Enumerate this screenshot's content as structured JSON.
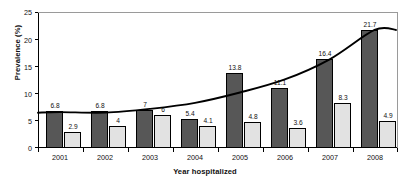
{
  "chart_data": {
    "type": "bar",
    "title": "",
    "xlabel": "Year hospitalized",
    "ylabel": "Prevalence (%)",
    "categories": [
      "2001",
      "2002",
      "2003",
      "2004",
      "2005",
      "2006",
      "2007",
      "2008"
    ],
    "ylim": [
      0,
      25
    ],
    "yticks": [
      "0",
      "5",
      "10",
      "15",
      "20",
      "25"
    ],
    "grid": false,
    "legend": "none",
    "series": [
      {
        "name": "dark-bars",
        "color": "#575757",
        "values": [
          6.8,
          6.8,
          7,
          5.4,
          13.8,
          11.1,
          16.4,
          21.7
        ],
        "labels": [
          "6.8",
          "6.8",
          "7",
          "5.4",
          "13.8",
          "11.1",
          "16.4",
          "21.7"
        ]
      },
      {
        "name": "light-bars",
        "color": "#e2e2e2",
        "values": [
          2.9,
          4,
          6,
          4.1,
          4.8,
          3.6,
          8.3,
          4.9
        ],
        "labels": [
          "2.9",
          "4",
          "6",
          "4.1",
          "4.8",
          "3.6",
          "8.3",
          "4.9"
        ]
      },
      {
        "name": "trend-line",
        "color": "#000000",
        "values": [
          6.6,
          6.5,
          7.2,
          8.3,
          10.2,
          12.6,
          16.3,
          21.7
        ]
      }
    ]
  },
  "caption": ""
}
